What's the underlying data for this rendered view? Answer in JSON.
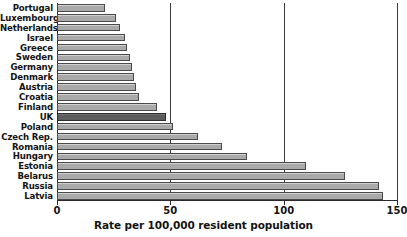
{
  "chart_data": {
    "type": "bar",
    "orientation": "horizontal",
    "title": "",
    "xlabel": "Rate per 100,000 resident population",
    "ylabel": "",
    "xlim": [
      0,
      150
    ],
    "xticks": [
      0,
      50,
      100,
      150
    ],
    "xtick_labels": [
      "0",
      "50",
      "100",
      "150"
    ],
    "grid": true,
    "grid_axis": "x",
    "legend": null,
    "highlight_category": "UK",
    "colors": {
      "bar_fill": "#a9a9a9",
      "bar_edge": "#4a4a4a",
      "highlight_fill": "#5c5c5c",
      "highlight_edge": "#2e2e2e",
      "gridline": "#3a3a3a",
      "axis": "#2b2b2b",
      "text": "#141414",
      "background": "#ffffff"
    },
    "categories": [
      "Portugal",
      "Luxembourg",
      "Netherlands",
      "Israel",
      "Greece",
      "Sweden",
      "Germany",
      "Denmark",
      "Austria",
      "Croatia",
      "Finland",
      "UK",
      "Poland",
      "Czech Rep.",
      "Romania",
      "Hungary",
      "Estonia",
      "Belarus",
      "Russia",
      "Latvia"
    ],
    "values": [
      21,
      26,
      28,
      30,
      31,
      32,
      33,
      34,
      35,
      36,
      44,
      48,
      51,
      62,
      73,
      84,
      110,
      127,
      142,
      144
    ],
    "bars": [
      {
        "label": "Portugal",
        "value": 21,
        "highlight": false
      },
      {
        "label": "Luxembourg",
        "value": 26,
        "highlight": false
      },
      {
        "label": "Netherlands",
        "value": 28,
        "highlight": false
      },
      {
        "label": "Israel",
        "value": 30,
        "highlight": false
      },
      {
        "label": "Greece",
        "value": 31,
        "highlight": false
      },
      {
        "label": "Sweden",
        "value": 32,
        "highlight": false
      },
      {
        "label": "Germany",
        "value": 33,
        "highlight": false
      },
      {
        "label": "Denmark",
        "value": 34,
        "highlight": false
      },
      {
        "label": "Austria",
        "value": 35,
        "highlight": false
      },
      {
        "label": "Croatia",
        "value": 36,
        "highlight": false
      },
      {
        "label": "Finland",
        "value": 44,
        "highlight": false
      },
      {
        "label": "UK",
        "value": 48,
        "highlight": true
      },
      {
        "label": "Poland",
        "value": 51,
        "highlight": false
      },
      {
        "label": "Czech Rep.",
        "value": 62,
        "highlight": false
      },
      {
        "label": "Romania",
        "value": 73,
        "highlight": false
      },
      {
        "label": "Hungary",
        "value": 84,
        "highlight": false
      },
      {
        "label": "Estonia",
        "value": 110,
        "highlight": false
      },
      {
        "label": "Belarus",
        "value": 127,
        "highlight": false
      },
      {
        "label": "Russia",
        "value": 142,
        "highlight": false
      },
      {
        "label": "Latvia",
        "value": 144,
        "highlight": false
      }
    ]
  }
}
